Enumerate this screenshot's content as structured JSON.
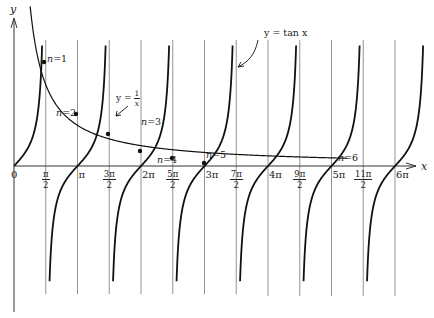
{
  "figure": {
    "axis_labels": {
      "x": "x",
      "y": "y"
    },
    "origin_label": "0",
    "curve_labels": {
      "tan": "y = tan x",
      "reciprocal_prefix": "y =",
      "reciprocal_num": "1",
      "reciprocal_den": "x"
    },
    "tick_labels": [
      {
        "kind": "frac",
        "num": "π",
        "den": "2",
        "value": 1.5708
      },
      {
        "kind": "plain",
        "text": "π",
        "value": 3.1416
      },
      {
        "kind": "frac",
        "num": "3π",
        "den": "2",
        "value": 4.7124
      },
      {
        "kind": "plain",
        "text": "2π",
        "value": 6.2832
      },
      {
        "kind": "frac",
        "num": "5π",
        "den": "2",
        "value": 7.854
      },
      {
        "kind": "plain",
        "text": "3π",
        "value": 9.4248
      },
      {
        "kind": "frac",
        "num": "7π",
        "den": "2",
        "value": 10.9956
      },
      {
        "kind": "plain",
        "text": "4π",
        "value": 12.5664
      },
      {
        "kind": "frac",
        "num": "9π",
        "den": "2",
        "value": 14.1372
      },
      {
        "kind": "plain",
        "text": "5π",
        "value": 15.708
      },
      {
        "kind": "frac",
        "num": "11π",
        "den": "2",
        "value": 17.2788
      },
      {
        "kind": "plain",
        "text": "6π",
        "value": 18.8496
      }
    ],
    "intersections": [
      {
        "label": "n = 1",
        "n": 1
      },
      {
        "label": "n = 2",
        "n": 2
      },
      {
        "label": "n = 3",
        "n": 3
      },
      {
        "label": "n = 4",
        "n": 4
      },
      {
        "label": "n = 5",
        "n": 5
      },
      {
        "label": "n = 6",
        "n": 6
      }
    ],
    "colors": {
      "curve": "#111111",
      "grid": "#888888",
      "axis": "#333333",
      "text": "#222222"
    }
  }
}
